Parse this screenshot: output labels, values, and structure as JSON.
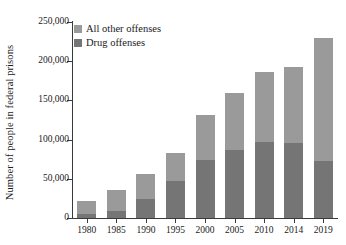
{
  "chart_data": {
    "type": "bar",
    "title": "",
    "subtitle": "",
    "xlabel": "",
    "ylabel": "Number of people in federal prisons",
    "categories": [
      "1980",
      "1985",
      "1990",
      "1995",
      "2000",
      "2005",
      "2010",
      "2014",
      "2019"
    ],
    "series": [
      {
        "name": "Drug offenses",
        "color": "#757575",
        "values": [
          4800,
          9500,
          24000,
          47000,
          74000,
          87000,
          97000,
          96000,
          73000
        ]
      },
      {
        "name": "All other offenses",
        "color": "#9a9a9a",
        "values": [
          17200,
          26500,
          32000,
          36000,
          57000,
          73000,
          89000,
          96000,
          156000
        ]
      }
    ],
    "totals": [
      22000,
      36000,
      56000,
      83000,
      131000,
      160000,
      186000,
      192000,
      229000
    ],
    "stacked": true,
    "stack_order_bottom_to_top": [
      "Drug offenses",
      "All other offenses"
    ],
    "ylim": [
      0,
      250000
    ],
    "ytick_values": [
      0,
      50000,
      100000,
      150000,
      200000,
      250000
    ],
    "ytick_labels": [
      "0",
      "50,000",
      "100,000",
      "150,000",
      "200,000",
      "250,000"
    ],
    "grid": false,
    "legend_position": "top-left",
    "legend_entries": [
      "All other offenses",
      "Drug offenses"
    ],
    "axis_color": "#3a3a3a",
    "text_color": "#1a1a1a",
    "background": "#ffffff"
  }
}
